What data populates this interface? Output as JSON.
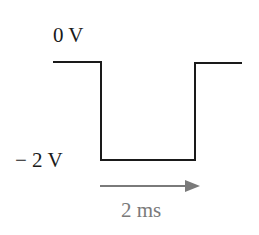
{
  "diagram": {
    "type": "square-pulse-waveform",
    "labels": {
      "high_level": "0 V",
      "low_level": "− 2 V",
      "duration": "2 ms"
    },
    "colors": {
      "waveform": "#1a1a1a",
      "arrow": "#7a7a7a",
      "duration_text": "#7a7a7a"
    },
    "waveform_points": [
      [
        53,
        62
      ],
      [
        101,
        62
      ],
      [
        101,
        160
      ],
      [
        195,
        160
      ],
      [
        195,
        63
      ],
      [
        242,
        63
      ]
    ],
    "arrow": {
      "x1": 100,
      "x2": 200,
      "y": 186
    }
  }
}
